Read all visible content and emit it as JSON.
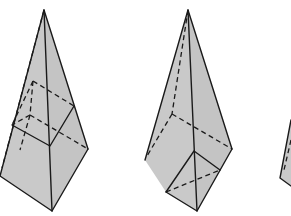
{
  "figure": {
    "colors": {
      "face_fill": "#c9c9c9",
      "edge": "#1a1a1a",
      "background": "#ffffff"
    },
    "pyramids": [
      {
        "id": "pyramid-1",
        "apex": [
          44,
          10
        ],
        "visible_outline": [
          [
            44,
            10
          ],
          [
            0,
            176
          ],
          [
            52,
            211
          ],
          [
            88,
            149
          ]
        ],
        "front_edge": [
          [
            44,
            10
          ],
          [
            52,
            211
          ]
        ],
        "inscribed_cube": "upper-middle position, visible top edges solid, back edges dashed"
      },
      {
        "id": "pyramid-2",
        "apex": [
          188,
          10
        ],
        "visible_outline": [
          [
            188,
            10
          ],
          [
            145,
            160
          ],
          [
            197,
            211
          ],
          [
            232,
            149
          ]
        ],
        "front_edge": [
          [
            188,
            10
          ],
          [
            197,
            211
          ]
        ],
        "inscribed_cube": "at base, front corner near bottom"
      },
      {
        "id": "pyramid-3",
        "note": "partially visible at right edge"
      }
    ]
  }
}
